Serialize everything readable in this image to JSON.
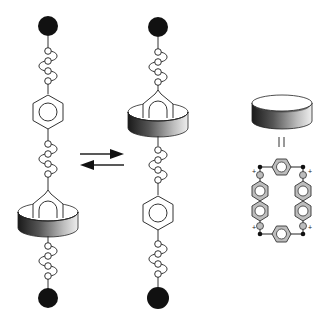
{
  "diagram": {
    "type": "molecular-shuttle-schematic",
    "colors": {
      "stopper": "#111111",
      "line": "#333333",
      "ring_dark": "#1a1a1a",
      "ring_light": "#e8e8e8",
      "cyclophane_fill": "#bdbdbd",
      "background": "#ffffff"
    },
    "states": [
      {
        "id": "left",
        "ring_position": "lower-station",
        "axle_x": 48
      },
      {
        "id": "right",
        "ring_position": "upper-station",
        "axle_x": 158
      }
    ],
    "equilibrium_arrows": {
      "forward": "right",
      "reverse": "left"
    },
    "legend": {
      "equals_symbol": "||",
      "ring_structure": "tetracationic cyclophane",
      "charges": [
        "+",
        "+",
        "+",
        "+"
      ]
    }
  }
}
